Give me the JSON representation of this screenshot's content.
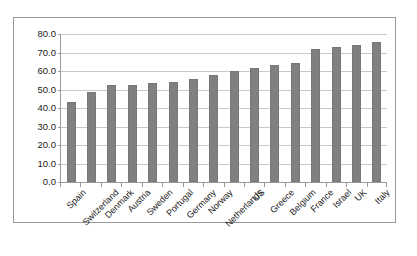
{
  "chart_data": {
    "type": "bar",
    "title": "",
    "subtitle": "",
    "xlabel": "",
    "ylabel": "",
    "categories": [
      "Spain",
      "Switzerland",
      "Denmark",
      "Austria",
      "Sweden",
      "Portugal",
      "Germany",
      "Norway",
      "Netherlands",
      "US",
      "Greece",
      "Belgium",
      "France",
      "Israel",
      "UK",
      "Italy"
    ],
    "values": [
      43.5,
      48.8,
      52.7,
      52.7,
      53.5,
      53.8,
      55.6,
      58.0,
      59.8,
      61.6,
      63.5,
      64.5,
      71.8,
      72.8,
      74.0,
      75.6
    ],
    "ylim": [
      0,
      80
    ],
    "ytick_labels": [
      "0.0",
      "10.0",
      "20.0",
      "30.0",
      "40.0",
      "50.0",
      "60.0",
      "70.0",
      "80.0"
    ],
    "ytick_values": [
      0,
      10,
      20,
      30,
      40,
      50,
      60,
      70,
      80
    ],
    "grid": true,
    "legend": false,
    "legend_position": "none",
    "series": [
      {
        "name": "",
        "values": [
          43.5,
          48.8,
          52.7,
          52.7,
          53.5,
          53.8,
          55.6,
          58.0,
          59.8,
          61.6,
          63.5,
          64.5,
          71.8,
          72.8,
          74.0,
          75.6
        ]
      }
    ]
  },
  "style": {
    "bar_color": "#808080",
    "bar_border_color": "#787878",
    "gridline_color": "#c8c8c8",
    "axis_color": "#9a9a9a",
    "frame_color": "#9a9a9a",
    "text_color": "#1a1a1a",
    "background": "#ffffff"
  }
}
